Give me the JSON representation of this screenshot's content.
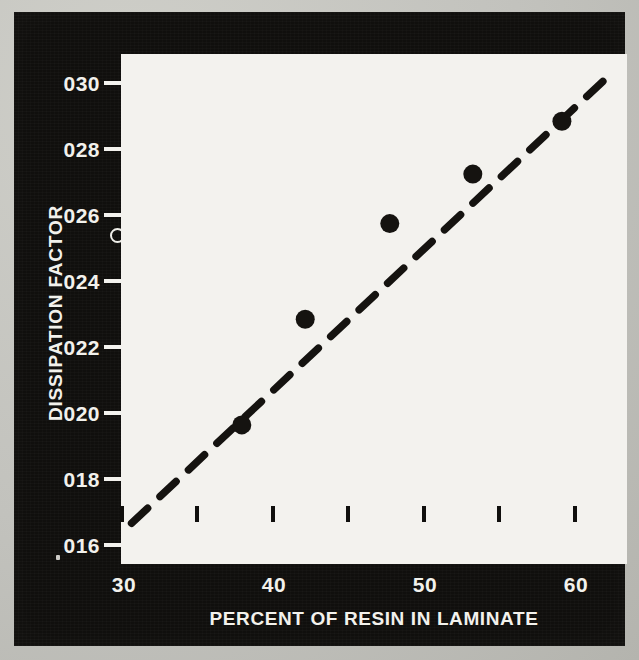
{
  "chart_data": {
    "type": "scatter",
    "title": "",
    "xlabel": "PERCENT OF RESIN IN LAMINATE",
    "ylabel": "DISSIPATION FACTOR",
    "xlim": [
      30,
      63.7
    ],
    "ylim": [
      0.0152,
      0.0306
    ],
    "grid": false,
    "legend": null,
    "x_major_ticks": [
      30,
      40,
      50,
      60
    ],
    "x_major_tick_labels": [
      "30",
      "40",
      "50",
      "60"
    ],
    "x_minor_ticks": [
      35,
      45,
      55
    ],
    "y_ticks": [
      0.03,
      0.028,
      0.026,
      0.024,
      0.022,
      0.02,
      0.018,
      0.016
    ],
    "y_tick_labels": [
      "030",
      "028",
      "026",
      "024",
      "022",
      "020",
      "018",
      "016"
    ],
    "series": [
      {
        "name": "measured data",
        "marker": "filled-circle",
        "color": "#151310",
        "points": [
          {
            "x": 38.0,
            "y": 0.0197
          },
          {
            "x": 42.2,
            "y": 0.0229
          },
          {
            "x": 47.8,
            "y": 0.0258
          },
          {
            "x": 53.3,
            "y": 0.0273
          },
          {
            "x": 59.2,
            "y": 0.0289
          }
        ]
      },
      {
        "name": "trend line",
        "marker": "none",
        "style": "dashed",
        "color": "#151310",
        "points": [
          {
            "x": 30.7,
            "y": 0.01672
          },
          {
            "x": 62.4,
            "y": 0.03032
          }
        ]
      }
    ],
    "annotations": [
      {
        "name": "stray-open-circle-artifact",
        "near_label": "026"
      }
    ]
  },
  "axes": {
    "y_title": "DISSIPATION FACTOR",
    "x_title": "PERCENT OF RESIN IN LAMINATE",
    "y_tick_labels": [
      "030",
      "028",
      "026",
      "024",
      "022",
      "020",
      "018",
      "016"
    ],
    "x_tick_labels": [
      "30",
      "40",
      "50",
      "60"
    ]
  },
  "colors": {
    "panel_background": "#100f0d",
    "plot_background": "#f3f2ee",
    "ink": "#151310",
    "label_text": "#f2f1ec",
    "page_background": "#c2c2bd"
  }
}
